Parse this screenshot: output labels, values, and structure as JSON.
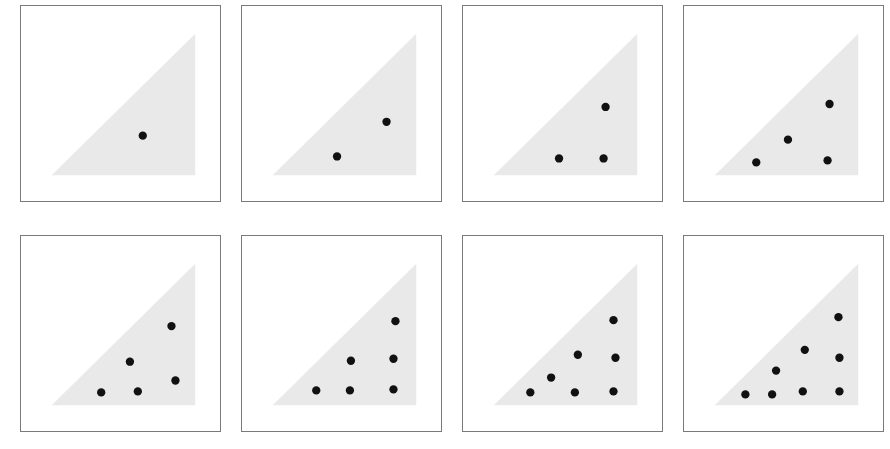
{
  "figure": {
    "panel_count": 8,
    "rows": 2,
    "columns": 4,
    "background_color": "#ffffff",
    "triangle_fill_color": "#e9e9e9",
    "dot_color": "#111111",
    "panel_border_color": "#7a7a7a",
    "dot_radius": 4.2
  },
  "geometry": {
    "panel_width": 201,
    "panel_height": 197,
    "triangle": {
      "apex_x": 176,
      "apex_y": 28,
      "bottom_right_x": 176,
      "bottom_right_y": 171,
      "bottom_left_x": 31,
      "bottom_left_y": 171,
      "description": "right triangle, right angle at bottom-right, hypotenuse from bottom-left up to top-right"
    },
    "lattice": {
      "origin_x": 45,
      "origin_y": 161,
      "step_x": 31.5,
      "step_y": -30.5,
      "shear_x": 15.7
    }
  },
  "panels": [
    {
      "index": 1,
      "label": "panel-1",
      "dot_count": 1,
      "dots": [
        {
          "i": 2,
          "j": 0
        }
      ]
    },
    {
      "index": 2,
      "label": "panel-2",
      "dot_count": 2,
      "dots": [
        {
          "i": 1,
          "j": 0
        },
        {
          "i": 2,
          "j": 1
        }
      ]
    },
    {
      "index": 3,
      "label": "panel-3",
      "dot_count": 3,
      "dots": [
        {
          "i": 1,
          "j": 0
        },
        {
          "i": 3,
          "j": 0
        },
        {
          "i": 2,
          "j": 1
        }
      ]
    },
    {
      "index": 4,
      "label": "panel-4",
      "dot_count": 4,
      "dots": [
        {
          "i": 1,
          "j": 0
        },
        {
          "i": 3,
          "j": 0
        },
        {
          "i": 1,
          "j": 1
        },
        {
          "i": 2,
          "j": 2
        }
      ]
    },
    {
      "index": 5,
      "label": "panel-5",
      "dot_count": 5,
      "dots": [
        {
          "i": 1,
          "j": 0
        },
        {
          "i": 2,
          "j": 0
        },
        {
          "i": 3,
          "j": 0
        },
        {
          "i": 1,
          "j": 1
        },
        {
          "i": 2,
          "j": 2
        }
      ]
    },
    {
      "index": 6,
      "label": "panel-6",
      "dot_count": 6,
      "dots": [
        {
          "i": 1,
          "j": 0
        },
        {
          "i": 2,
          "j": 0
        },
        {
          "i": 3,
          "j": 0
        },
        {
          "i": 1,
          "j": 1
        },
        {
          "i": 2,
          "j": 1
        },
        {
          "i": 2,
          "j": 2
        }
      ]
    },
    {
      "index": 7,
      "label": "panel-7",
      "dot_count": 7,
      "dots": [
        {
          "i": 0,
          "j": 0
        },
        {
          "i": 1,
          "j": 0
        },
        {
          "i": 2,
          "j": 0
        },
        {
          "i": 3,
          "j": 0
        },
        {
          "i": 0,
          "j": 1
        },
        {
          "i": 1,
          "j": 1
        },
        {
          "i": 2,
          "j": 1
        },
        {
          "i": 2,
          "j": 2
        }
      ]
    },
    {
      "index": 8,
      "label": "panel-8",
      "dot_count": 8,
      "dots": [
        {
          "i": 0,
          "j": 0
        },
        {
          "i": 1,
          "j": 0
        },
        {
          "i": 2,
          "j": 0
        },
        {
          "i": 3,
          "j": 0
        },
        {
          "i": 0,
          "j": 1
        },
        {
          "i": 1,
          "j": 1
        },
        {
          "i": 2,
          "j": 1
        },
        {
          "i": 2,
          "j": 2
        }
      ]
    }
  ],
  "panel_positions": [
    {
      "left": 20,
      "top": 5,
      "width": 201,
      "height": 197
    },
    {
      "left": 241,
      "top": 5,
      "width": 201,
      "height": 197
    },
    {
      "left": 462,
      "top": 5,
      "width": 201,
      "height": 197
    },
    {
      "left": 683,
      "top": 5,
      "width": 201,
      "height": 197
    },
    {
      "left": 20,
      "top": 235,
      "width": 201,
      "height": 197
    },
    {
      "left": 241,
      "top": 235,
      "width": 201,
      "height": 197
    },
    {
      "left": 462,
      "top": 235,
      "width": 201,
      "height": 197
    },
    {
      "left": 683,
      "top": 235,
      "width": 201,
      "height": 197
    }
  ],
  "dot_overrides": {
    "1": [
      {
        "x": 123,
        "y": 131
      }
    ],
    "2": [
      {
        "x": 96,
        "y": 152
      },
      {
        "x": 146,
        "y": 117
      }
    ],
    "3": [
      {
        "x": 97,
        "y": 154
      },
      {
        "x": 142,
        "y": 154
      },
      {
        "x": 144,
        "y": 102
      }
    ],
    "4": [
      {
        "x": 73,
        "y": 158
      },
      {
        "x": 145,
        "y": 156
      },
      {
        "x": 105,
        "y": 135
      },
      {
        "x": 147,
        "y": 99
      }
    ],
    "5": [
      {
        "x": 81,
        "y": 158
      },
      {
        "x": 118,
        "y": 157
      },
      {
        "x": 156,
        "y": 146
      },
      {
        "x": 110,
        "y": 127
      },
      {
        "x": 152,
        "y": 91
      }
    ],
    "6": [
      {
        "x": 75,
        "y": 156
      },
      {
        "x": 109,
        "y": 156
      },
      {
        "x": 153,
        "y": 155
      },
      {
        "x": 110,
        "y": 126
      },
      {
        "x": 153,
        "y": 124
      },
      {
        "x": 155,
        "y": 86
      }
    ],
    "7": [
      {
        "x": 68,
        "y": 158
      },
      {
        "x": 113,
        "y": 158
      },
      {
        "x": 152,
        "y": 157
      },
      {
        "x": 89,
        "y": 143
      },
      {
        "x": 116,
        "y": 120
      },
      {
        "x": 154,
        "y": 123
      },
      {
        "x": 152,
        "y": 85
      }
    ],
    "8": [
      {
        "x": 62,
        "y": 160
      },
      {
        "x": 89,
        "y": 160
      },
      {
        "x": 120,
        "y": 157
      },
      {
        "x": 157,
        "y": 157
      },
      {
        "x": 93,
        "y": 136
      },
      {
        "x": 122,
        "y": 115
      },
      {
        "x": 157,
        "y": 123
      },
      {
        "x": 156,
        "y": 82
      }
    ]
  }
}
